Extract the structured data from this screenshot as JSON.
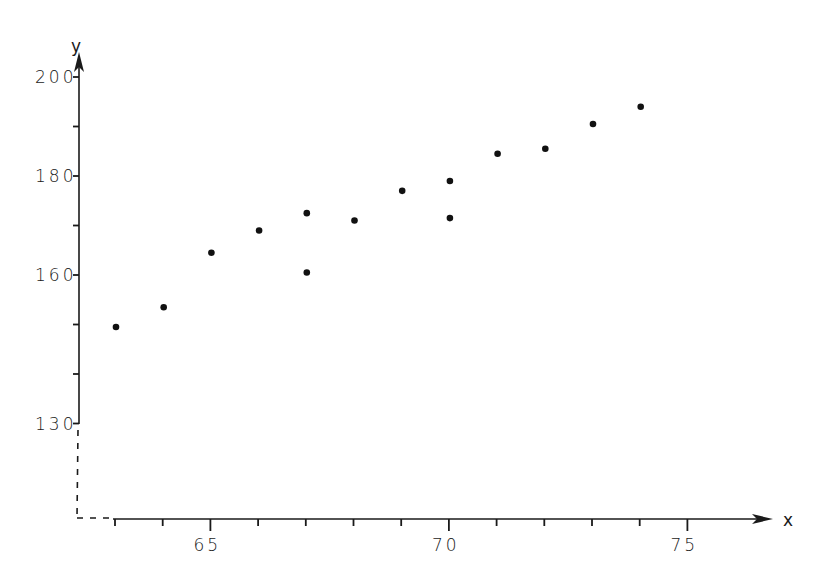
{
  "chart_data": {
    "type": "scatter",
    "title": "",
    "xlabel": "x",
    "ylabel": "y",
    "xlim": [
      63,
      76.7
    ],
    "ylim": [
      130,
      203
    ],
    "axis_break": {
      "x_from": 0,
      "x_to": 63,
      "y_from": 0,
      "y_to": 130,
      "style": "dashed"
    },
    "grid": false,
    "legend": null,
    "x_ticks": [
      63,
      64,
      65,
      66,
      67,
      68,
      69,
      70,
      71,
      72,
      73,
      74,
      75
    ],
    "x_tick_labels": [
      {
        "value": 65,
        "label": "65"
      },
      {
        "value": 70,
        "label": "70"
      },
      {
        "value": 75,
        "label": "75"
      }
    ],
    "y_ticks": [
      130,
      140,
      150,
      160,
      170,
      180,
      190,
      200
    ],
    "y_tick_labels": [
      {
        "value": 130,
        "label": "130"
      },
      {
        "value": 160,
        "label": "160"
      },
      {
        "value": 180,
        "label": "180"
      },
      {
        "value": 200,
        "label": "200"
      }
    ],
    "series": [
      {
        "name": "observations",
        "points": [
          {
            "x": 63,
            "y": 149.5
          },
          {
            "x": 64,
            "y": 153.5
          },
          {
            "x": 65,
            "y": 164.5
          },
          {
            "x": 66,
            "y": 169
          },
          {
            "x": 67,
            "y": 172.5
          },
          {
            "x": 67,
            "y": 160.5
          },
          {
            "x": 68,
            "y": 171
          },
          {
            "x": 69,
            "y": 177
          },
          {
            "x": 70,
            "y": 179
          },
          {
            "x": 70,
            "y": 171.5
          },
          {
            "x": 71,
            "y": 184.5
          },
          {
            "x": 72,
            "y": 185.5
          },
          {
            "x": 73,
            "y": 190.5
          },
          {
            "x": 74,
            "y": 194
          }
        ]
      }
    ]
  },
  "labels": {
    "x_axis": "x",
    "y_axis": "y"
  }
}
